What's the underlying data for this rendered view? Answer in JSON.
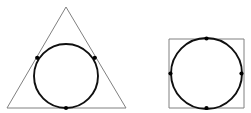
{
  "figure": {
    "canvas": {
      "width": 251,
      "height": 113,
      "background": "#ffffff"
    },
    "styles": {
      "polygon_stroke_color": "#808080",
      "polygon_stroke_width": 1,
      "circle_stroke_color": "#101010",
      "circle_stroke_width": 1.9,
      "dot_color": "#000000",
      "dot_radius": 2.1
    }
  },
  "shapes": [
    {
      "id": "triangle-figure",
      "name": "triangle-with-inscribed-circle",
      "polygon": {
        "type": "triangle",
        "sides": 3,
        "points": "66,7 126,108 7,108",
        "vertices": [
          {
            "label": "apex",
            "x": 66,
            "y": 7
          },
          {
            "label": "bottom-right",
            "x": 126,
            "y": 108
          },
          {
            "label": "bottom-left",
            "x": 7,
            "y": 108
          }
        ]
      },
      "circle": {
        "type": "incircle",
        "cx": 66,
        "cy": 76,
        "r": 32
      },
      "tangent_points": [
        {
          "label": "left-side-tangency",
          "x": 37.2,
          "y": 57.8
        },
        {
          "label": "right-side-tangency",
          "x": 94.8,
          "y": 57.8
        },
        {
          "label": "base-tangency",
          "x": 66,
          "y": 108
        }
      ]
    },
    {
      "id": "square-figure",
      "name": "square-with-inscribed-circle",
      "polygon": {
        "type": "square",
        "sides": 4,
        "points": "169,39 244,39 244,108 169,108",
        "vertices": [
          {
            "label": "top-left",
            "x": 169,
            "y": 39
          },
          {
            "label": "top-right",
            "x": 244,
            "y": 39
          },
          {
            "label": "bottom-right",
            "x": 244,
            "y": 108
          },
          {
            "label": "bottom-left",
            "x": 169,
            "y": 108
          }
        ]
      },
      "circle": {
        "type": "incircle",
        "cx": 206.5,
        "cy": 73.5,
        "r": 35.5
      },
      "tangent_points": [
        {
          "label": "top-tangency",
          "x": 206.5,
          "y": 38.5
        },
        {
          "label": "right-tangency",
          "x": 241.5,
          "y": 73.5
        },
        {
          "label": "bottom-tangency",
          "x": 206.5,
          "y": 108
        },
        {
          "label": "left-tangency",
          "x": 170.5,
          "y": 73.5
        }
      ]
    }
  ]
}
